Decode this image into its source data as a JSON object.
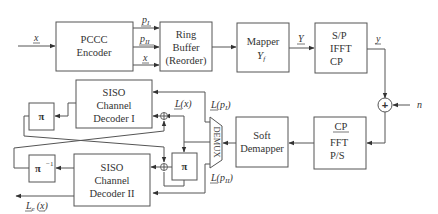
{
  "diagram": {
    "blocks": {
      "pccc_encoder": [
        "PCCC",
        "Encoder"
      ],
      "ring_buffer": [
        "Ring",
        "Buffer",
        "(Reorder)"
      ],
      "mapper": [
        "Mapper",
        "Y",
        "f"
      ],
      "ifft": [
        "S/P",
        "IFFT",
        "CP"
      ],
      "adder": "+",
      "fft": [
        "CP",
        "FFT",
        "P/S"
      ],
      "soft_demapper": [
        "Soft",
        "Demapper"
      ],
      "demux": "DEMUX",
      "decoder1": [
        "SISO",
        "Channel",
        "Decoder I"
      ],
      "decoder2": [
        "SISO",
        "Channel",
        "Decoder II"
      ],
      "interleaver_top": "π",
      "interleaver_mid": "π",
      "deinterleaver": "π",
      "deinterleaver_sup": "−1"
    },
    "signals": {
      "input_x": "x",
      "p1": "p",
      "p1_sub": "I",
      "p2": "p",
      "p2_sub": "II",
      "sys_x": "x",
      "y_mapper": "Y",
      "y_time": "y",
      "noise": "n",
      "Lx": "L(x)",
      "Lp1": "L(p",
      "Lp1_sub": "I",
      "Lp1_close": ")",
      "Lp2": "L(p",
      "Lp2_sub": "II",
      "Lp2_close": ")",
      "output_L": "L",
      "output_L_sub": "e",
      "output_x": "(x)"
    },
    "colors": {
      "stroke": "#555555",
      "text": "#333333",
      "background": "#ffffff"
    }
  }
}
